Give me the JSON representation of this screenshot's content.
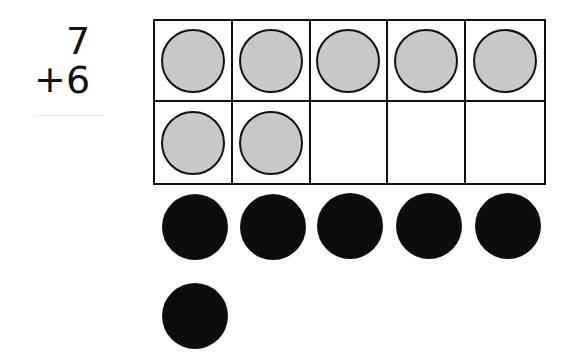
{
  "problem": {
    "addend1": "7",
    "operator": "+",
    "addend2": "6"
  },
  "ten_frame": {
    "rows": 2,
    "cols": 5,
    "filled_count": 7,
    "counter_color": "#c8c8c8"
  },
  "extra_counters": {
    "count": 6,
    "color": "#0d0d0d"
  }
}
